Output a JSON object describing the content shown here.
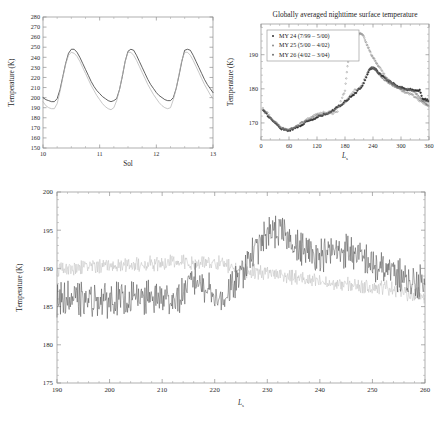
{
  "figure": {
    "background": "#ffffff",
    "ink": "#2e2e2e",
    "ink_light": "#b4b4b4"
  },
  "chart_data": [
    {
      "id": "panel-sol",
      "type": "line",
      "title": "",
      "xlabel": "Sol",
      "ylabel": "Temperature (K)",
      "xlim": [
        10,
        13
      ],
      "ylim": [
        150,
        280
      ],
      "xticks": [
        10,
        11,
        12,
        13
      ],
      "yticks": [
        150,
        160,
        170,
        180,
        190,
        200,
        210,
        220,
        230,
        240,
        250,
        260,
        270,
        280
      ],
      "grid": false,
      "legend": "none",
      "series": [
        {
          "name": "dark-curve",
          "color": "#2e2e2e",
          "x": [
            10.0,
            10.05,
            10.1,
            10.15,
            10.2,
            10.25,
            10.3,
            10.35,
            10.4,
            10.45,
            10.5,
            10.55,
            10.6,
            10.65,
            10.7,
            10.75,
            10.8,
            10.85,
            10.9,
            10.95,
            11.0,
            11.05,
            11.1,
            11.15,
            11.2,
            11.25,
            11.3,
            11.35,
            11.4,
            11.45,
            11.5,
            11.55,
            11.6,
            11.65,
            11.7,
            11.75,
            11.8,
            11.85,
            11.9,
            11.95,
            12.0,
            12.05,
            12.1,
            12.15,
            12.2,
            12.25,
            12.3,
            12.35,
            12.4,
            12.45,
            12.5,
            12.55,
            12.6,
            12.65,
            12.7,
            12.75,
            12.8,
            12.85,
            12.9,
            12.95,
            13.0
          ],
          "y": [
            200,
            198,
            197,
            196,
            196,
            199,
            208,
            221,
            234,
            244,
            248,
            248,
            245,
            240,
            234,
            228,
            222,
            216,
            211,
            207,
            204,
            201,
            199,
            197,
            196,
            197,
            199,
            208,
            221,
            236,
            246,
            248,
            247,
            242,
            236,
            230,
            224,
            218,
            213,
            209,
            205,
            202,
            200,
            198,
            197,
            197,
            200,
            209,
            222,
            236,
            247,
            248,
            247,
            242,
            236,
            230,
            224,
            218,
            213,
            209,
            205
          ]
        },
        {
          "name": "light-curve",
          "color": "#b4b4b4",
          "x": [
            10.0,
            10.05,
            10.1,
            10.15,
            10.2,
            10.25,
            10.3,
            10.35,
            10.4,
            10.45,
            10.5,
            10.55,
            10.6,
            10.65,
            10.7,
            10.75,
            10.8,
            10.85,
            10.9,
            10.95,
            11.0,
            11.05,
            11.1,
            11.15,
            11.2,
            11.25,
            11.3,
            11.35,
            11.4,
            11.45,
            11.5,
            11.55,
            11.6,
            11.65,
            11.7,
            11.75,
            11.8,
            11.85,
            11.9,
            11.95,
            12.0,
            12.05,
            12.1,
            12.15,
            12.2,
            12.25,
            12.3,
            12.35,
            12.4,
            12.45,
            12.5,
            12.55,
            12.6,
            12.65,
            12.7,
            12.75,
            12.8,
            12.85,
            12.9,
            12.95,
            13.0
          ],
          "y": [
            196,
            192,
            190,
            189,
            189,
            194,
            206,
            220,
            233,
            242,
            245,
            244,
            241,
            236,
            230,
            224,
            218,
            212,
            207,
            202,
            198,
            194,
            191,
            189,
            188,
            190,
            197,
            208,
            222,
            236,
            245,
            245,
            242,
            237,
            231,
            225,
            219,
            213,
            208,
            203,
            199,
            195,
            192,
            190,
            189,
            190,
            198,
            209,
            223,
            237,
            245,
            245,
            242,
            237,
            231,
            225,
            219,
            213,
            208,
            203,
            199
          ]
        }
      ]
    },
    {
      "id": "panel-ls",
      "type": "scatter",
      "title": "Globally averaged nighttime surface temperature",
      "xlabel": "Ls",
      "ylabel": "Temperature (K)",
      "xlim": [
        0,
        360
      ],
      "ylim": [
        165,
        199
      ],
      "xticks": [
        0,
        60,
        120,
        180,
        240,
        300,
        360
      ],
      "yticks": [
        170,
        180,
        190
      ],
      "grid": false,
      "legend": "upper left",
      "legend_entries": [
        {
          "label": "MY 24 (7/99 – 5/00)",
          "marker": "dot",
          "color": "#2e2e2e"
        },
        {
          "label": "MY 25 (5/00 – 4/02)",
          "marker": "dot",
          "color": "#8a8a8a"
        },
        {
          "label": "MY 26 (4/02 – 3/04)",
          "marker": "dot",
          "color": "#6f6f6f"
        }
      ],
      "series": [
        {
          "name": "MY 24 (7/99 – 5/00)",
          "color": "#2e2e2e",
          "x": [
            5,
            12,
            20,
            28,
            36,
            44,
            52,
            60,
            68,
            76,
            84,
            92,
            100,
            108,
            116,
            124,
            132,
            140,
            148,
            156,
            164,
            172,
            180,
            188,
            196,
            204,
            212,
            220,
            228,
            234,
            238,
            242,
            246,
            250,
            256,
            262,
            268,
            274,
            280,
            286,
            292,
            298,
            304,
            310,
            316,
            322,
            328,
            334,
            340,
            346,
            352,
            358
          ],
          "y": [
            173.6,
            172.6,
            171.4,
            170.3,
            169.2,
            168.4,
            168.0,
            167.9,
            168.2,
            168.7,
            169.3,
            169.9,
            170.4,
            170.9,
            171.3,
            171.9,
            172.3,
            172.6,
            173.1,
            173.8,
            174.6,
            175.4,
            176.3,
            177.2,
            178.1,
            179.0,
            180.1,
            181.6,
            184.4,
            185.9,
            186.2,
            186.1,
            185.6,
            185.0,
            184.2,
            183.5,
            182.8,
            182.3,
            181.8,
            181.3,
            180.9,
            180.5,
            180.2,
            180.0,
            179.8,
            179.7,
            179.6,
            179.6,
            179.5,
            177.3,
            176.9,
            176.6
          ]
        },
        {
          "name": "MY 25 (5/00 – 4/02)",
          "color": "#8a8a8a",
          "x": [
            4,
            14,
            24,
            34,
            44,
            54,
            64,
            74,
            84,
            94,
            104,
            114,
            124,
            134,
            144,
            154,
            164,
            174,
            180,
            184,
            188,
            192,
            196,
            200,
            204,
            208,
            212,
            216,
            220,
            224,
            228,
            232,
            236,
            240,
            244,
            248,
            252,
            258,
            264,
            270,
            276,
            282,
            288,
            294,
            300,
            306,
            312,
            318,
            324,
            330,
            336,
            342,
            348,
            354,
            359
          ],
          "y": [
            174.4,
            172.8,
            171.2,
            169.8,
            168.6,
            168.1,
            168.4,
            169.0,
            169.9,
            170.7,
            171.5,
            172.2,
            172.9,
            173.0,
            172.8,
            172.9,
            173.4,
            177.5,
            179.6,
            185.0,
            189.6,
            192.8,
            194.4,
            195.3,
            195.8,
            196.1,
            196.3,
            196.0,
            195.2,
            194.0,
            192.7,
            191.4,
            190.2,
            189.2,
            188.4,
            187.6,
            186.6,
            185.4,
            184.2,
            183.1,
            182.2,
            181.4,
            180.7,
            180.1,
            179.6,
            179.2,
            178.9,
            178.6,
            178.2,
            177.6,
            177.0,
            176.4,
            175.8,
            175.3,
            175.0
          ]
        },
        {
          "name": "MY 26 (4/02 – 3/04)",
          "color": "#6f6f6f",
          "x": [
            8,
            18,
            28,
            38,
            48,
            58,
            68,
            78,
            88,
            98,
            108,
            118,
            128,
            138,
            148,
            158,
            168,
            178,
            188,
            198,
            208,
            218,
            228,
            236,
            240,
            244,
            248,
            254,
            260,
            266,
            272,
            278,
            284,
            290,
            296,
            302,
            308,
            314,
            320,
            326,
            332,
            338,
            344,
            350,
            356
          ],
          "y": [
            173.0,
            171.8,
            170.4,
            169.3,
            168.3,
            167.9,
            168.3,
            169.1,
            170.0,
            170.8,
            171.4,
            172.0,
            172.5,
            172.8,
            173.2,
            173.9,
            174.8,
            175.9,
            177.6,
            179.3,
            180.0,
            181.4,
            184.8,
            186.1,
            186.2,
            185.8,
            185.2,
            184.3,
            183.4,
            182.6,
            182.0,
            181.5,
            181.0,
            180.6,
            180.3,
            180.0,
            179.8,
            179.7,
            179.6,
            179.4,
            178.6,
            177.6,
            176.9,
            176.2,
            175.6
          ]
        }
      ]
    },
    {
      "id": "panel-zoom",
      "type": "line",
      "title": "",
      "xlabel": "Ls",
      "ylabel": "Temperature (K)",
      "xlim": [
        190,
        260
      ],
      "ylim": [
        175,
        200
      ],
      "xticks": [
        190,
        200,
        210,
        220,
        230,
        240,
        250,
        260
      ],
      "yticks": [
        175,
        180,
        185,
        190,
        195,
        200
      ],
      "grid": false,
      "legend": "none",
      "series": [
        {
          "name": "dark-noisy",
          "color": "#3a3a3a",
          "description": "High-frequency noisy trace, baseline ~185-187 K rising to peak ~197 K near Ls 231, decaying to ~187 K by Ls 260",
          "baseline": [
            {
              "x": 190,
              "y": 186.0
            },
            {
              "x": 196,
              "y": 185.8
            },
            {
              "x": 202,
              "y": 185.9
            },
            {
              "x": 208,
              "y": 186.2
            },
            {
              "x": 213,
              "y": 186.0
            },
            {
              "x": 216,
              "y": 188.6
            },
            {
              "x": 219,
              "y": 187.4
            },
            {
              "x": 221,
              "y": 185.6
            },
            {
              "x": 224,
              "y": 188.0
            },
            {
              "x": 227,
              "y": 191.8
            },
            {
              "x": 229,
              "y": 193.6
            },
            {
              "x": 231,
              "y": 195.0
            },
            {
              "x": 233,
              "y": 194.6
            },
            {
              "x": 236,
              "y": 192.6
            },
            {
              "x": 239,
              "y": 191.8
            },
            {
              "x": 242,
              "y": 192.0
            },
            {
              "x": 245,
              "y": 192.4
            },
            {
              "x": 248,
              "y": 191.4
            },
            {
              "x": 251,
              "y": 190.0
            },
            {
              "x": 254,
              "y": 189.6
            },
            {
              "x": 257,
              "y": 188.0
            },
            {
              "x": 260,
              "y": 188.2
            }
          ],
          "amplitude": 1.7
        },
        {
          "name": "light-noisy",
          "color": "#b8b8b8",
          "description": "Lower-amplitude trace near 190 K flat through Ls 222, then merging downward to ~187 K",
          "baseline": [
            {
              "x": 190,
              "y": 189.8
            },
            {
              "x": 196,
              "y": 190.2
            },
            {
              "x": 202,
              "y": 190.4
            },
            {
              "x": 208,
              "y": 190.6
            },
            {
              "x": 213,
              "y": 190.8
            },
            {
              "x": 217,
              "y": 190.6
            },
            {
              "x": 221,
              "y": 190.7
            },
            {
              "x": 224,
              "y": 190.1
            },
            {
              "x": 227,
              "y": 189.6
            },
            {
              "x": 231,
              "y": 189.4
            },
            {
              "x": 234,
              "y": 189.0
            },
            {
              "x": 238,
              "y": 188.4
            },
            {
              "x": 242,
              "y": 188.0
            },
            {
              "x": 246,
              "y": 187.8
            },
            {
              "x": 250,
              "y": 187.6
            },
            {
              "x": 254,
              "y": 187.4
            },
            {
              "x": 257,
              "y": 186.6
            },
            {
              "x": 260,
              "y": 186.4
            }
          ],
          "amplitude": 0.75
        }
      ]
    }
  ]
}
